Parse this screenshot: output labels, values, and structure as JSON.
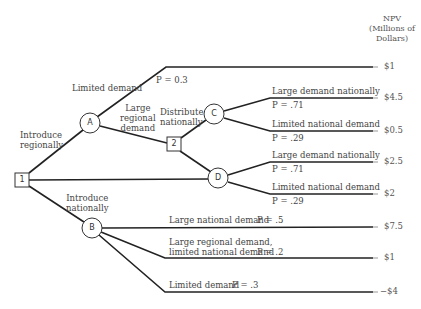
{
  "header": {
    "line1": "NPV",
    "line2": "(Millions of",
    "line3": "Dollars)"
  },
  "nodes": {
    "decision_1": "1",
    "decision_2": "2",
    "chance_A": "A",
    "chance_B": "B",
    "chance_C": "C",
    "chance_D": "D"
  },
  "labels": {
    "introduce_regionally_1": "Introduce",
    "introduce_regionally_2": "regionally",
    "introduce_nationally_1": "Introduce",
    "introduce_nationally_2": "nationally",
    "limited_demand_A": "Limited demand",
    "p_limited_A": "P = 0.3",
    "large_regional_1": "Large",
    "large_regional_2": "regional",
    "large_regional_3": "demand",
    "distribute_1": "Distribute",
    "distribute_2": "nationally",
    "C_large": "Large demand nationally",
    "C_large_p": "P = .71",
    "C_limited": "Limited national demand",
    "C_limited_p": "P = .29",
    "D_large": "Large demand nationally",
    "D_large_p": "P = .71",
    "D_limited": "Limited national demand",
    "D_limited_p": "P = .29",
    "B_large": "Large national demand",
    "B_large_p": "P = .5",
    "B_mixed_1": "Large regional demand,",
    "B_mixed_2": "limited national demand",
    "B_mixed_p": "P = .2",
    "B_limited": "Limited demand",
    "B_limited_p": "P = .3"
  },
  "outcomes": [
    {
      "path": "Regional / Limited demand",
      "npv": "$1"
    },
    {
      "path": "Regional / Large regional / Distribute / Large demand nationally",
      "npv": "$4.5"
    },
    {
      "path": "Regional / Large regional / Distribute / Limited national demand",
      "npv": "$0.5"
    },
    {
      "path": "Regional / Large regional / Don't distribute / Large demand nationally",
      "npv": "$2.5"
    },
    {
      "path": "Regional / Large regional / Don't distribute / Limited national demand",
      "npv": "$2"
    },
    {
      "path": "National / Large national demand",
      "npv": "$7.5"
    },
    {
      "path": "National / Large regional, limited national",
      "npv": "$1"
    },
    {
      "path": "National / Limited demand",
      "npv": "−$4"
    }
  ]
}
